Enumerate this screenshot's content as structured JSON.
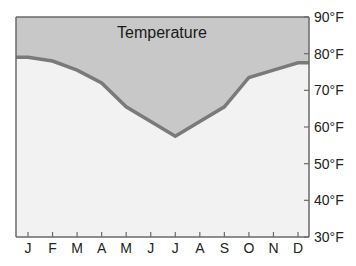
{
  "chart_data": {
    "type": "area",
    "title": "Temperature",
    "xlabel": "",
    "ylabel": "",
    "categories": [
      "J",
      "F",
      "M",
      "A",
      "M",
      "J",
      "J",
      "A",
      "S",
      "O",
      "N",
      "D"
    ],
    "series": [
      {
        "name": "Temperature",
        "values": [
          79,
          78,
          75.5,
          72,
          65.5,
          61.5,
          57.5,
          61.5,
          65.5,
          73.5,
          75.5,
          77.5
        ]
      }
    ],
    "start_value": 79,
    "end_value": 77.5,
    "ylim": [
      30,
      90
    ],
    "yticks": [
      30,
      40,
      50,
      60,
      70,
      80,
      90
    ],
    "ytick_labels": [
      "30°F",
      "40°F",
      "50°F",
      "60°F",
      "70°F",
      "80°F",
      "90°F"
    ],
    "y_axis_side": "right",
    "grid": false,
    "legend": "none",
    "colors": {
      "above_fill": "#c8c8c8",
      "below_fill": "#f2f2f2",
      "line": "#7a7a7a",
      "axis": "#6a6a6a"
    }
  }
}
